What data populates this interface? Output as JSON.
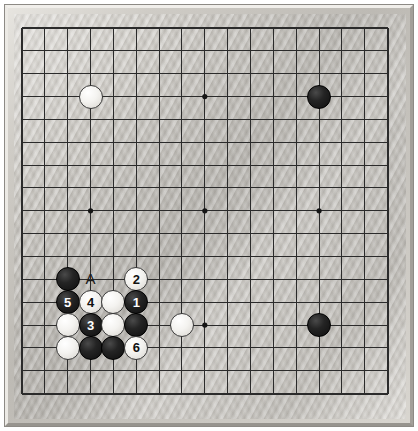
{
  "figure": {
    "name": "go-board-diagram",
    "kind": "go-board",
    "board_size": 17,
    "grid": {
      "origin_x": 22,
      "origin_y": 28,
      "spacing": 22.85,
      "lines": 17,
      "line_color": "#2b2b2b",
      "star_point_color": "#151515",
      "star_points": [
        {
          "col": 3,
          "row": 3
        },
        {
          "col": 8,
          "row": 3
        },
        {
          "col": 13,
          "row": 3
        },
        {
          "col": 3,
          "row": 8
        },
        {
          "col": 8,
          "row": 8
        },
        {
          "col": 13,
          "row": 8
        },
        {
          "col": 3,
          "row": 13
        },
        {
          "col": 8,
          "row": 13
        },
        {
          "col": 13,
          "row": 13
        }
      ]
    },
    "colors": {
      "board_wood": "#c4c1bb",
      "frame": "#cfccc6",
      "black_stone": "#141414",
      "white_stone": "#f6f5f2",
      "black_label_text": "#ffffff",
      "white_label_text": "#111111"
    },
    "stones": [
      {
        "id": "white-upper-left",
        "color": "white",
        "col": 3,
        "row": 3,
        "label": ""
      },
      {
        "id": "black-upper-right",
        "color": "black",
        "col": 13,
        "row": 3,
        "label": ""
      },
      {
        "id": "black-lower-right",
        "color": "black",
        "col": 13,
        "row": 13,
        "label": ""
      },
      {
        "id": "white-center-right",
        "color": "white",
        "col": 7,
        "row": 13,
        "label": ""
      },
      {
        "id": "black-corner-left",
        "color": "black",
        "col": 2,
        "row": 11,
        "label": ""
      },
      {
        "id": "white-move-2",
        "color": "white",
        "col": 5,
        "row": 11,
        "label": "2"
      },
      {
        "id": "black-move-5",
        "color": "black",
        "col": 2,
        "row": 12,
        "label": "5"
      },
      {
        "id": "white-move-4",
        "color": "white",
        "col": 3,
        "row": 12,
        "label": "4"
      },
      {
        "id": "white-plain-a",
        "color": "white",
        "col": 4,
        "row": 12,
        "label": ""
      },
      {
        "id": "black-move-1",
        "color": "black",
        "col": 5,
        "row": 12,
        "label": "1"
      },
      {
        "id": "white-plain-b",
        "color": "white",
        "col": 2,
        "row": 13,
        "label": ""
      },
      {
        "id": "black-move-3",
        "color": "black",
        "col": 3,
        "row": 13,
        "label": "3"
      },
      {
        "id": "white-plain-c",
        "color": "white",
        "col": 4,
        "row": 13,
        "label": ""
      },
      {
        "id": "black-plain-d",
        "color": "black",
        "col": 5,
        "row": 13,
        "label": ""
      },
      {
        "id": "white-plain-e",
        "color": "white",
        "col": 2,
        "row": 14,
        "label": ""
      },
      {
        "id": "black-plain-f",
        "color": "black",
        "col": 3,
        "row": 14,
        "label": ""
      },
      {
        "id": "black-plain-g",
        "color": "black",
        "col": 4,
        "row": 14,
        "label": ""
      },
      {
        "id": "white-move-6",
        "color": "white",
        "col": 5,
        "row": 14,
        "label": "6"
      }
    ],
    "markers": [
      {
        "id": "point-a",
        "text": "A",
        "col": 3,
        "row": 11
      }
    ]
  }
}
